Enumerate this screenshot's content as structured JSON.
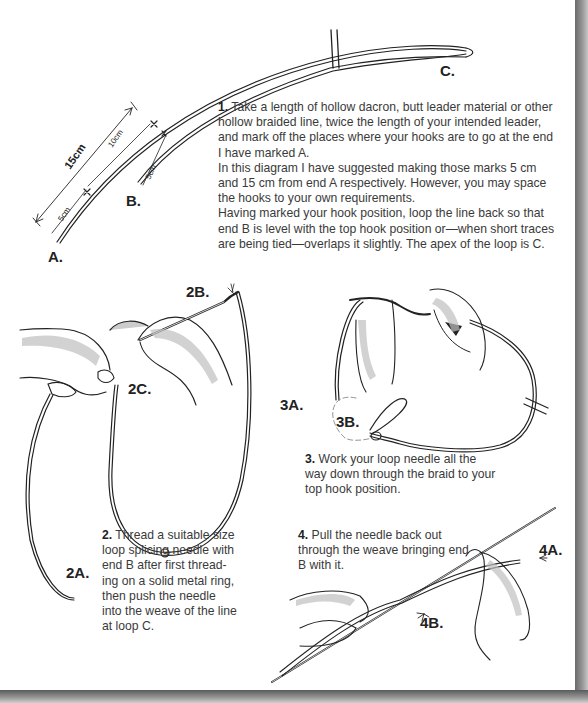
{
  "page": {
    "labels": {
      "A": "A.",
      "B": "B.",
      "C": "C.",
      "m15": "15cm",
      "m10": "10cm",
      "m5a": "5cm",
      "m5b": "5cm",
      "s2A": "2A.",
      "s2B": "2B.",
      "s2C": "2C.",
      "s3A": "3A.",
      "s3B": "3B.",
      "s4A": "4A.",
      "s4B": "4B."
    },
    "steps": [
      {
        "number": "1.",
        "paragraphs": [
          "Take a length of hollow dacron, butt leader material or other hollow braided line, twice the length of your intended leader, and mark off the places where your hooks are to go at the end I have marked A.",
          "In this diagram I have suggested making those marks 5 cm and 15 cm from end A respectively. However, you may space the hooks to your own requirements.",
          "Having marked your hook position, loop the line back so that end B is level with the top hook position or—when short traces are being tied—overlaps it slightly. The apex of the loop is C."
        ]
      },
      {
        "number": "2.",
        "paragraphs": [
          "Thread a suitable size loop splicing needle with end B after first thread-ing on a solid metal ring, then push the needle into the weave of the line at loop C."
        ]
      },
      {
        "number": "3.",
        "paragraphs": [
          "Work your loop needle all the way down through the braid to your top hook position."
        ]
      },
      {
        "number": "4.",
        "paragraphs": [
          "Pull the needle back out through the weave bringing end B with it."
        ]
      }
    ],
    "colors": {
      "ink": "#222222",
      "text": "#3a3a3a",
      "shade": "#b8b8b8",
      "shadow": "#7a7a7a"
    }
  }
}
